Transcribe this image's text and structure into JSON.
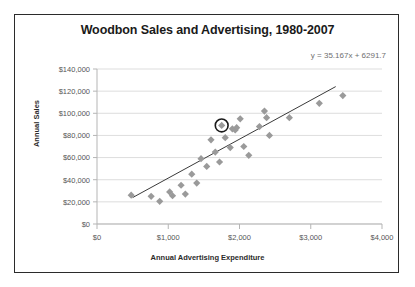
{
  "chart_data": {
    "type": "scatter",
    "title": "Woodbon Sales and Advertising, 1980-2007",
    "xlabel": "Annual Advertising Expenditure",
    "ylabel": "Annual Sales",
    "xlim": [
      0,
      4000
    ],
    "ylim": [
      0,
      140000
    ],
    "grid": "horizontal",
    "legend": "none",
    "annotations": [
      {
        "name": "trendline-equation",
        "text": "y = 35.167x + 6291.7"
      }
    ],
    "xticklabels": [
      "$0",
      "$1,000",
      "$2,000",
      "$3,000",
      "$4,000"
    ],
    "xtickvalues": [
      0,
      1000,
      2000,
      3000,
      4000
    ],
    "yticklabels": [
      "$0",
      "$20,000",
      "$40,000",
      "$60,000",
      "$80,000",
      "$100,000",
      "$120,000",
      "$140,000"
    ],
    "ytickvalues": [
      0,
      20000,
      40000,
      60000,
      80000,
      100000,
      120000,
      140000
    ],
    "marker_color": "#9a9a9a",
    "trendline_color": "#3a3a3a",
    "highlight_color": "#1a1a1a",
    "series": [
      {
        "name": "Annual Sales vs Advertising",
        "points": [
          {
            "x": 480,
            "y": 26000
          },
          {
            "x": 760,
            "y": 25000
          },
          {
            "x": 880,
            "y": 20500
          },
          {
            "x": 1020,
            "y": 29000
          },
          {
            "x": 1060,
            "y": 25500
          },
          {
            "x": 1180,
            "y": 35000
          },
          {
            "x": 1240,
            "y": 27000
          },
          {
            "x": 1330,
            "y": 45000
          },
          {
            "x": 1400,
            "y": 37000
          },
          {
            "x": 1460,
            "y": 59000
          },
          {
            "x": 1540,
            "y": 52000
          },
          {
            "x": 1600,
            "y": 76000
          },
          {
            "x": 1660,
            "y": 65000
          },
          {
            "x": 1720,
            "y": 56000
          },
          {
            "x": 1750,
            "y": 89000
          },
          {
            "x": 1800,
            "y": 78000
          },
          {
            "x": 1870,
            "y": 69000
          },
          {
            "x": 1900,
            "y": 86000
          },
          {
            "x": 1940,
            "y": 85000
          },
          {
            "x": 1960,
            "y": 87000
          },
          {
            "x": 2010,
            "y": 95000
          },
          {
            "x": 2060,
            "y": 70000
          },
          {
            "x": 2130,
            "y": 62000
          },
          {
            "x": 2280,
            "y": 88000
          },
          {
            "x": 2350,
            "y": 102000
          },
          {
            "x": 2380,
            "y": 96000
          },
          {
            "x": 2420,
            "y": 80000
          },
          {
            "x": 2700,
            "y": 96000
          },
          {
            "x": 3120,
            "y": 109000
          },
          {
            "x": 3450,
            "y": 116000
          }
        ]
      }
    ],
    "highlighted_point": {
      "x": 1750,
      "y": 89000
    },
    "trendline": {
      "slope": 35.167,
      "intercept": 6291.7,
      "x_start": 500,
      "x_end": 3350
    }
  }
}
